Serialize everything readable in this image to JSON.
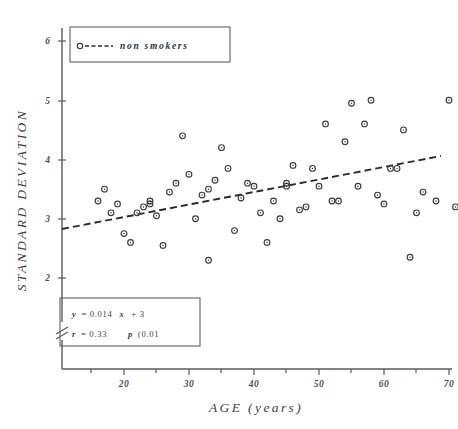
{
  "figure": {
    "kind": "scatter-plot",
    "background_color": "#ffffff",
    "ink_color": "#3b3b3b"
  },
  "chart_data": {
    "type": "scatter",
    "title": "",
    "xlabel": "AGE (years)",
    "ylabel": "STANDARD DEVIATION",
    "xlim": [
      13,
      73
    ],
    "ylim": [
      1.6,
      6.2
    ],
    "xticks": [
      20,
      30,
      40,
      50,
      60,
      70
    ],
    "yticks": [
      2,
      3,
      4,
      5,
      6
    ],
    "grid": false,
    "y_axis_break": true,
    "legend_position": "top-left",
    "series": [
      {
        "name": "non smokers",
        "marker": "open-circle",
        "x": [
          16,
          17,
          18,
          19,
          20,
          21,
          22,
          23,
          24,
          24,
          25,
          26,
          27,
          28,
          29,
          30,
          31,
          32,
          33,
          33,
          34,
          35,
          36,
          37,
          38,
          39,
          40,
          41,
          42,
          43,
          44,
          45,
          45,
          46,
          47,
          48,
          49,
          50,
          51,
          52,
          53,
          54,
          55,
          56,
          57,
          58,
          59,
          60,
          61,
          62,
          63,
          64,
          65,
          66,
          68,
          70,
          71
        ],
        "y": [
          3.3,
          3.5,
          3.1,
          3.25,
          2.75,
          2.6,
          3.1,
          3.2,
          3.25,
          3.3,
          3.05,
          2.55,
          3.45,
          3.6,
          4.4,
          3.75,
          3.0,
          3.4,
          2.3,
          3.5,
          3.65,
          4.2,
          3.85,
          2.8,
          3.35,
          3.6,
          3.55,
          3.1,
          2.6,
          3.3,
          3.0,
          3.55,
          3.6,
          3.9,
          3.15,
          3.2,
          3.85,
          3.55,
          4.6,
          3.3,
          3.3,
          4.3,
          4.95,
          3.55,
          4.6,
          5.0,
          3.4,
          3.25,
          3.85,
          3.85,
          4.5,
          2.35,
          3.1,
          3.45,
          3.3,
          5.0,
          3.2
        ]
      }
    ],
    "regression_line": {
      "equation": "y= 0.014 x + 3",
      "style": "dashed",
      "x_start": 14,
      "y_start": 2.98,
      "x_end": 72,
      "y_end": 4.02
    },
    "annotations": {
      "equation": "y= 0.014 x + 3",
      "equation_lhs": "y",
      "equation_rhs": "= 0.014",
      "equation_var": "x",
      "equation_tail": "+ 3",
      "r_label": "r",
      "r_value": "= 0.33",
      "p_label": "p",
      "p_value": "(0.01"
    }
  },
  "legend": {
    "marker_icon": "open-circle-marker",
    "line_icon": "dashed-line-icon",
    "label": "non smokers"
  },
  "stats_box": {
    "line1_a": "y",
    "line1_b": "= 0.014",
    "line1_c": "x",
    "line1_d": "+ 3",
    "line2_a": "r",
    "line2_b": "= 0.33",
    "line2_c": "p",
    "line2_d": "(0.01"
  },
  "axes": {
    "x_title": "AGE (years)",
    "y_title": "STANDARD DEVIATION",
    "x_tick_labels": [
      "20",
      "30",
      "40",
      "50",
      "60",
      "70"
    ],
    "y_tick_labels": [
      "2",
      "3",
      "4",
      "5",
      "6"
    ]
  }
}
